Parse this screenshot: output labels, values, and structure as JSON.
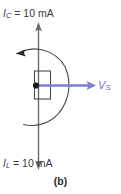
{
  "figure": {
    "caption": "(b)",
    "labels": {
      "capacitive_current": {
        "symbol": "I",
        "subscript": "C",
        "text": " = 10 mA",
        "full": "IC = 10 mA",
        "value": "10",
        "unit": "mA"
      },
      "inductive_current": {
        "symbol": "I",
        "subscript": "L",
        "text": " = 10 mA",
        "full": "IL = 10 mA",
        "value": "10",
        "unit": "mA"
      },
      "source_voltage": {
        "symbol": "V",
        "subscript": "S",
        "full": "VS"
      }
    },
    "colors": {
      "source_arrow": "#7c7fd1",
      "line": "#6b6b6b",
      "node": "#1a1a1a",
      "text": "#3a3a3a"
    },
    "elements": [
      {
        "name": "up-arrow-capacitive-current",
        "direction": "up"
      },
      {
        "name": "down-arrow-inductive-current",
        "direction": "down"
      },
      {
        "name": "resistor-rectangle"
      },
      {
        "name": "node-dot"
      },
      {
        "name": "current-loop-arc",
        "arrow": "left"
      },
      {
        "name": "source-voltage-arrow",
        "direction": "right"
      }
    ]
  }
}
